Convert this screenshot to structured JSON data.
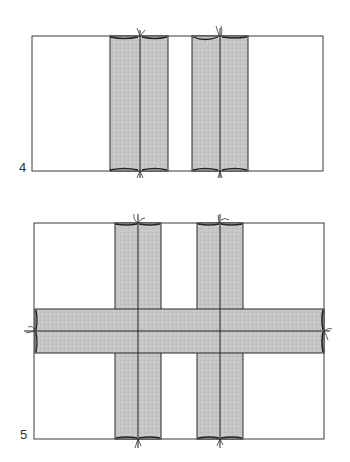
{
  "colors": {
    "outline": "#3a3a3a",
    "strip_fill": "#c6c6c6",
    "paper": "#ffffff"
  },
  "steps": [
    {
      "label": "4",
      "panel": {
        "x": 32,
        "y": 36,
        "w": 291,
        "h": 135
      },
      "vertical_strips": [
        {
          "x": 110,
          "w": 58,
          "fold_x": 140
        },
        {
          "x": 192,
          "w": 56,
          "fold_x": 220
        }
      ],
      "horizontal_strips": []
    },
    {
      "label": "5",
      "panel": {
        "x": 34,
        "y": 223,
        "w": 290,
        "h": 216
      },
      "vertical_strips": [
        {
          "x": 115,
          "w": 46,
          "fold_x": 138
        },
        {
          "x": 197,
          "w": 46,
          "fold_x": 220
        }
      ],
      "horizontal_strips": [
        {
          "y": 309,
          "h": 44,
          "fold_y": 331
        }
      ]
    }
  ]
}
